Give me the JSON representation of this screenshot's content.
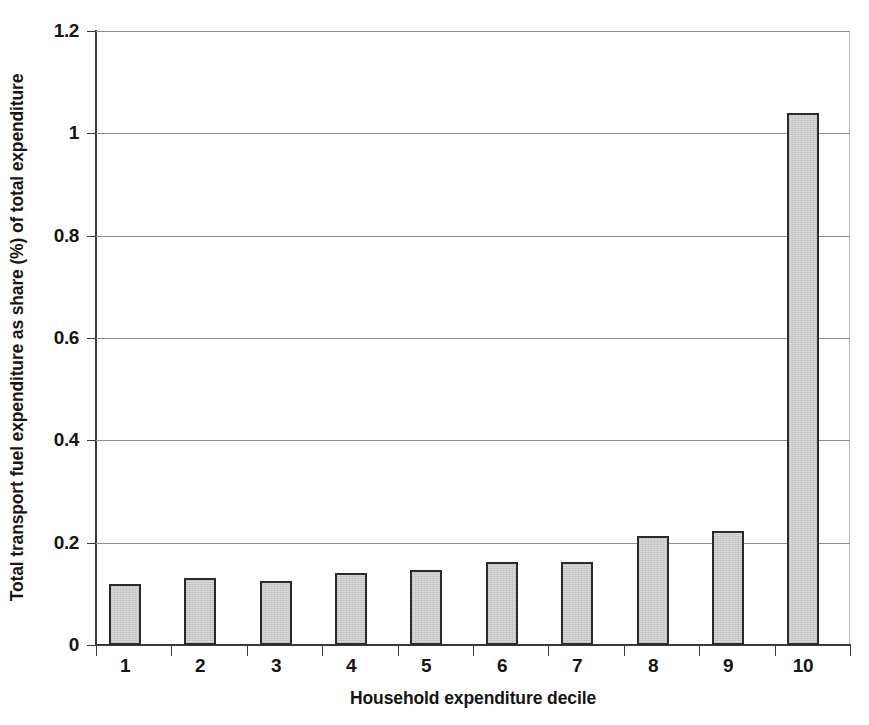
{
  "chart_data": {
    "type": "bar",
    "title": "",
    "xlabel": "Household expenditure decile",
    "ylabel": "Total transport fuel expenditure as share (%) of total expenditure",
    "categories": [
      "1",
      "2",
      "3",
      "4",
      "5",
      "6",
      "7",
      "8",
      "9",
      "10"
    ],
    "values": [
      0.12,
      0.13,
      0.125,
      0.14,
      0.147,
      0.162,
      0.162,
      0.213,
      0.222,
      1.04
    ],
    "series": [
      {
        "name": "Total transport fuel expenditure share",
        "values": [
          0.12,
          0.13,
          0.125,
          0.14,
          0.147,
          0.162,
          0.162,
          0.213,
          0.222,
          1.04
        ]
      }
    ],
    "ylim": [
      0,
      1.2
    ],
    "ytick_labels": [
      "0",
      "0.2",
      "0.4",
      "0.6",
      "0.8",
      "1",
      "1.2"
    ],
    "ytick_values": [
      0,
      0.2,
      0.4,
      0.6,
      0.8,
      1.0,
      1.2
    ],
    "grid": true,
    "grid_axis": "y",
    "legend": false,
    "legend_position": "none",
    "bar_fill_color": "#d9d9d9",
    "bar_border_color": "#2b2b2b",
    "background_color": "#ffffff",
    "gridline_color": "#8e8e8e",
    "axis_color": "#3a3a3a"
  }
}
